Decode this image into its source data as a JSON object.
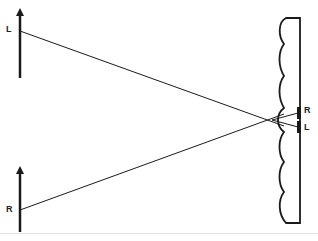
{
  "diagram": {
    "type": "stereoscopic viewing geometry",
    "objects": [
      {
        "id": "left-object",
        "label": "L",
        "x": 20,
        "top": 10,
        "bottom": 78,
        "ray_y": 31
      },
      {
        "id": "right-object",
        "label": "R",
        "x": 20,
        "top": 166,
        "bottom": 232,
        "ray_y": 210
      }
    ],
    "viewer": {
      "description": "head profile facing left with retinal images",
      "convergence_point": {
        "x": 272,
        "y": 120
      },
      "retina_labels": [
        "R",
        "L"
      ]
    },
    "colors": {
      "line": "#1a1a1a",
      "background": "#ffffff"
    }
  },
  "labels": {
    "top_object": "L",
    "bottom_object": "R",
    "retina_upper": "R",
    "retina_lower": "L"
  }
}
